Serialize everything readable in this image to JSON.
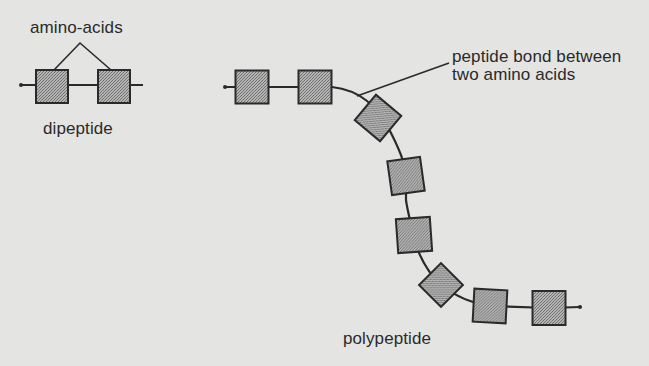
{
  "diagram": {
    "colors": {
      "background": "#e4e4e2",
      "ink": "#2a2a2a",
      "amino_acid_fill": "#a9a9a9"
    },
    "labels": {
      "amino_acids": "amino-acids",
      "dipeptide": "dipeptide",
      "peptide_bond_line1": "peptide bond between",
      "peptide_bond_line2": "two amino acids",
      "polypeptide": "polypeptide"
    },
    "dipeptide": {
      "amino_acid_count": 2,
      "units": [
        {
          "cx": 52,
          "cy": 86,
          "rotation": 0
        },
        {
          "cx": 114,
          "cy": 86,
          "rotation": 0
        }
      ]
    },
    "polypeptide": {
      "amino_acid_count": 8,
      "units": [
        {
          "cx": 252,
          "cy": 87,
          "rotation": 0
        },
        {
          "cx": 315,
          "cy": 87,
          "rotation": 0
        },
        {
          "cx": 378,
          "cy": 118,
          "rotation": 40
        },
        {
          "cx": 406,
          "cy": 176,
          "rotation": -8
        },
        {
          "cx": 414,
          "cy": 235,
          "rotation": -4
        },
        {
          "cx": 441,
          "cy": 285,
          "rotation": 45
        },
        {
          "cx": 490,
          "cy": 306,
          "rotation": 3
        },
        {
          "cx": 549,
          "cy": 308,
          "rotation": 0
        }
      ]
    }
  }
}
